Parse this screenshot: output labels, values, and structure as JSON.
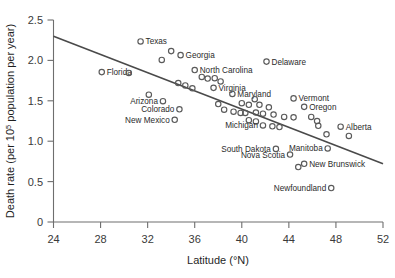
{
  "chart_data": {
    "type": "scatter",
    "title": "",
    "xlabel": "Latitude (°N)",
    "ylabel": "Death rate (per 10⁵ population per year)",
    "xlim": [
      24,
      52
    ],
    "ylim": [
      0,
      2.5
    ],
    "xticks": [
      24,
      28,
      32,
      36,
      40,
      44,
      48,
      52
    ],
    "xtick_labels": [
      "24",
      "28",
      "32",
      "36",
      "40",
      "44",
      "48",
      "52"
    ],
    "yticks": [
      0,
      0.5,
      1.0,
      1.5,
      2.0,
      2.5
    ],
    "ytick_labels": [
      "0",
      "0.5",
      "1.0",
      "1.5",
      "2.0",
      "2.5"
    ],
    "grid": false,
    "legend": "none",
    "trendline": {
      "type": "linear",
      "x_start": 24.0,
      "y_start": 2.3,
      "x_end": 52.0,
      "y_end": 0.72,
      "slope": -0.0564,
      "intercept": 3.654
    },
    "points": [
      {
        "label": "Florida",
        "x": 28.1,
        "y": 1.855,
        "label_pos": "right"
      },
      {
        "label": "",
        "x": 30.4,
        "y": 1.845,
        "label_pos": "none"
      },
      {
        "label": "Texas",
        "x": 31.4,
        "y": 2.235,
        "label_pos": "right"
      },
      {
        "label": "",
        "x": 32.1,
        "y": 1.575,
        "label_pos": "none"
      },
      {
        "label": "Arizona",
        "x": 33.3,
        "y": 1.495,
        "label_pos": "left"
      },
      {
        "label": "Colorado",
        "x": 34.7,
        "y": 1.395,
        "label_pos": "left"
      },
      {
        "label": "New Mexico",
        "x": 34.3,
        "y": 1.265,
        "label_pos": "left"
      },
      {
        "label": "",
        "x": 33.2,
        "y": 2.005,
        "label_pos": "none"
      },
      {
        "label": "",
        "x": 34.0,
        "y": 2.115,
        "label_pos": "none"
      },
      {
        "label": "Georgia",
        "x": 34.8,
        "y": 2.065,
        "label_pos": "right"
      },
      {
        "label": "North Carolina",
        "x": 36.0,
        "y": 1.88,
        "label_pos": "right"
      },
      {
        "label": "",
        "x": 34.6,
        "y": 1.72,
        "label_pos": "none"
      },
      {
        "label": "",
        "x": 35.2,
        "y": 1.69,
        "label_pos": "none"
      },
      {
        "label": "",
        "x": 35.8,
        "y": 1.655,
        "label_pos": "none"
      },
      {
        "label": "",
        "x": 36.6,
        "y": 1.795,
        "label_pos": "none"
      },
      {
        "label": "",
        "x": 37.1,
        "y": 1.775,
        "label_pos": "none"
      },
      {
        "label": "",
        "x": 37.7,
        "y": 1.78,
        "label_pos": "none"
      },
      {
        "label": "Virginia",
        "x": 37.6,
        "y": 1.66,
        "label_pos": "right"
      },
      {
        "label": "",
        "x": 38.2,
        "y": 1.74,
        "label_pos": "none"
      },
      {
        "label": "Maryland",
        "x": 39.2,
        "y": 1.585,
        "label_pos": "right"
      },
      {
        "label": "Delaware",
        "x": 42.1,
        "y": 1.985,
        "label_pos": "right"
      },
      {
        "label": "",
        "x": 38.0,
        "y": 1.46,
        "label_pos": "none"
      },
      {
        "label": "",
        "x": 38.5,
        "y": 1.39,
        "label_pos": "none"
      },
      {
        "label": "",
        "x": 39.3,
        "y": 1.365,
        "label_pos": "none"
      },
      {
        "label": "",
        "x": 39.9,
        "y": 1.35,
        "label_pos": "none"
      },
      {
        "label": "",
        "x": 40.3,
        "y": 1.35,
        "label_pos": "none"
      },
      {
        "label": "",
        "x": 40.0,
        "y": 1.47,
        "label_pos": "none"
      },
      {
        "label": "",
        "x": 40.6,
        "y": 1.45,
        "label_pos": "none"
      },
      {
        "label": "",
        "x": 41.1,
        "y": 1.52,
        "label_pos": "none"
      },
      {
        "label": "",
        "x": 41.5,
        "y": 1.45,
        "label_pos": "none"
      },
      {
        "label": "",
        "x": 41.2,
        "y": 1.355,
        "label_pos": "none"
      },
      {
        "label": "",
        "x": 41.8,
        "y": 1.34,
        "label_pos": "none"
      },
      {
        "label": "",
        "x": 42.3,
        "y": 1.42,
        "label_pos": "none"
      },
      {
        "label": "",
        "x": 42.7,
        "y": 1.33,
        "label_pos": "none"
      },
      {
        "label": "",
        "x": 40.6,
        "y": 1.26,
        "label_pos": "none"
      },
      {
        "label": "",
        "x": 41.2,
        "y": 1.245,
        "label_pos": "none"
      },
      {
        "label": "Michigan",
        "x": 41.8,
        "y": 1.195,
        "label_pos": "left"
      },
      {
        "label": "",
        "x": 42.6,
        "y": 1.185,
        "label_pos": "none"
      },
      {
        "label": "",
        "x": 43.2,
        "y": 1.175,
        "label_pos": "none"
      },
      {
        "label": "",
        "x": 43.6,
        "y": 1.3,
        "label_pos": "none"
      },
      {
        "label": "Vermont",
        "x": 44.4,
        "y": 1.53,
        "label_pos": "right"
      },
      {
        "label": "Oregon",
        "x": 45.3,
        "y": 1.425,
        "label_pos": "right"
      },
      {
        "label": "",
        "x": 44.4,
        "y": 1.295,
        "label_pos": "none"
      },
      {
        "label": "",
        "x": 45.9,
        "y": 1.3,
        "label_pos": "none"
      },
      {
        "label": "",
        "x": 46.4,
        "y": 1.25,
        "label_pos": "none"
      },
      {
        "label": "",
        "x": 46.5,
        "y": 1.19,
        "label_pos": "none"
      },
      {
        "label": "",
        "x": 47.2,
        "y": 1.085,
        "label_pos": "none"
      },
      {
        "label": "Alberta",
        "x": 48.4,
        "y": 1.18,
        "label_pos": "right"
      },
      {
        "label": "",
        "x": 49.1,
        "y": 1.065,
        "label_pos": "none"
      },
      {
        "label": "Manitoba",
        "x": 47.3,
        "y": 0.91,
        "label_pos": "left"
      },
      {
        "label": "South Dakota",
        "x": 42.9,
        "y": 0.905,
        "label_pos": "left"
      },
      {
        "label": "Nova Scotia",
        "x": 44.1,
        "y": 0.835,
        "label_pos": "left"
      },
      {
        "label": "New Brunswick",
        "x": 45.3,
        "y": 0.72,
        "label_pos": "right"
      },
      {
        "label": "",
        "x": 44.8,
        "y": 0.68,
        "label_pos": "none"
      },
      {
        "label": "Newfoundland",
        "x": 47.6,
        "y": 0.42,
        "label_pos": "left"
      }
    ]
  },
  "colors": {
    "axis": "#6e6e6e",
    "marker_stroke": "#5a5a5a",
    "trendline": "#4a4a4a",
    "text": "#2b2b2b",
    "background": "#ffffff"
  }
}
